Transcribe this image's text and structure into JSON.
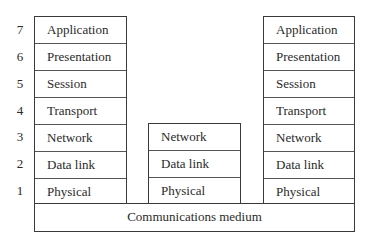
{
  "layer_numbers": [
    "7",
    "6",
    "5",
    "4",
    "3",
    "2",
    "1"
  ],
  "left_stack": {
    "layers": [
      "Application",
      "Presentation",
      "Session",
      "Transport",
      "Network",
      "Data link",
      "Physical"
    ]
  },
  "middle_stack": {
    "layers": [
      "Network",
      "Data link",
      "Physical"
    ]
  },
  "right_stack": {
    "layers": [
      "Application",
      "Presentation",
      "Session",
      "Transport",
      "Network",
      "Data link",
      "Physical"
    ]
  },
  "medium": {
    "label": "Communications medium"
  }
}
